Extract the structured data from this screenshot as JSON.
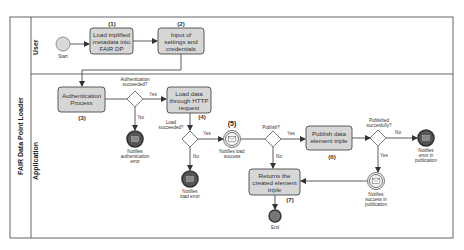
{
  "pool": {
    "title": "FAIR Data Point Loader",
    "lanes": [
      {
        "id": "user",
        "label": "User"
      },
      {
        "id": "application",
        "label": "Application"
      }
    ]
  },
  "events": {
    "start": {
      "label": "Start"
    },
    "end": {
      "label": "End"
    },
    "auth_error": {
      "label_lines": [
        "Notifies",
        "authentication",
        "error"
      ]
    },
    "load_error": {
      "label_lines": [
        "Notifies",
        "load error"
      ]
    },
    "load_success": {
      "number": "(5)",
      "label_lines": [
        "Notifies load",
        "success"
      ]
    },
    "pub_error": {
      "label_lines": [
        "Notifies",
        "error in",
        "publication"
      ]
    },
    "pub_success": {
      "label_lines": [
        "Notifies",
        "success in",
        "publication"
      ]
    }
  },
  "tasks": {
    "t1": {
      "number": "(1)",
      "lines": [
        "Load triplified",
        "metadata into",
        "FAIR DP"
      ]
    },
    "t2": {
      "number": "(2)",
      "lines": [
        "Input of",
        "settings and",
        "credentials"
      ]
    },
    "t3": {
      "number": "(3)",
      "lines": [
        "Authentication",
        "Process"
      ]
    },
    "t4": {
      "number": "(4)",
      "lines": [
        "Load data",
        "through HTTP",
        "request"
      ]
    },
    "t6": {
      "number": "(6)",
      "lines": [
        "Publish data",
        "element triple"
      ]
    },
    "t7": {
      "number": "(7)",
      "lines": [
        "Returns the",
        "created element",
        "triple"
      ]
    }
  },
  "gateways": {
    "auth": {
      "question_lines": [
        "Authentication",
        "succeeded?"
      ],
      "yes": "Yes",
      "no": "No"
    },
    "load": {
      "question_lines": [
        "Load",
        "succeeded?"
      ],
      "yes": "Yes",
      "no": "No"
    },
    "publish": {
      "question_lines": [
        "Publish?"
      ],
      "yes": "Yes",
      "no": "No"
    },
    "published": {
      "question_lines": [
        "Published",
        "succesfully?"
      ],
      "yes": "Yes",
      "no": "No"
    }
  },
  "colors": {
    "task_fill": "#d6d6d6",
    "stroke": "#4a4a4a",
    "end_fill": "#555555",
    "start_fill": "#d9d9d9"
  }
}
